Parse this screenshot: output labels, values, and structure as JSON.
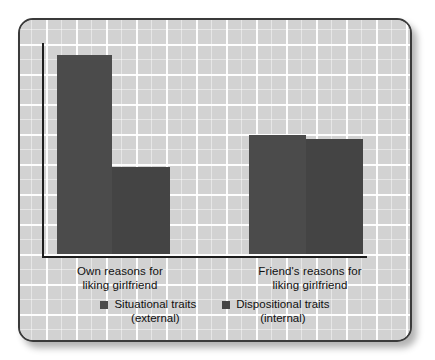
{
  "figure": {
    "panel_border_color": "#3a3a3a",
    "background_color": "#d2d2d2",
    "grid_line_color": "#ffffff",
    "axis_color": "#1d1d1d"
  },
  "chart_data": {
    "type": "bar",
    "title": "",
    "subtitle": "",
    "xlabel": "",
    "ylabel": "",
    "grid": true,
    "legend_position": "bottom",
    "categories": [
      "Own reasons for\nliking girlfriend",
      "Friend's reasons for\nliking girlfriend"
    ],
    "category_labels": [
      {
        "line1": "Own reasons for",
        "line2": "liking girlfriend"
      },
      {
        "line1": "Friend's reasons for",
        "line2": "liking girlfriend"
      }
    ],
    "series": [
      {
        "name": "Situational traits (external)",
        "name_line1": "Situational traits",
        "name_line2": "(external)",
        "color": "#4b4b4b",
        "values": [
          199,
          119
        ]
      },
      {
        "name": "Dispositional traits (internal)",
        "name_line1": "Dispositional traits",
        "name_line2": "(internal)",
        "color": "#444444",
        "values": [
          87,
          115
        ]
      }
    ],
    "ylim": [
      0,
      215
    ],
    "bars": [
      {
        "group": 0,
        "series": 0,
        "left": 37,
        "width": 55,
        "height": 199,
        "color": "#4b4b4b"
      },
      {
        "group": 0,
        "series": 1,
        "left": 92,
        "width": 58,
        "height": 87,
        "color": "#444444"
      },
      {
        "group": 1,
        "series": 0,
        "left": 229,
        "width": 57,
        "height": 119,
        "color": "#4b4b4b"
      },
      {
        "group": 1,
        "series": 1,
        "left": 286,
        "width": 57,
        "height": 115,
        "color": "#444444"
      }
    ]
  }
}
